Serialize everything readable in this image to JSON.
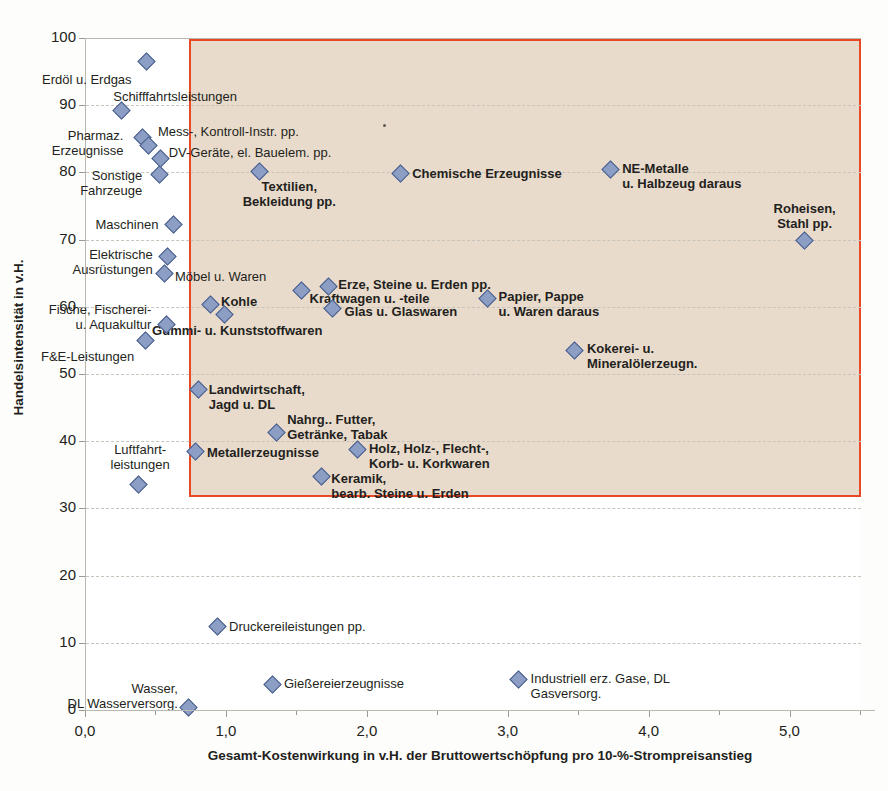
{
  "chart_data": {
    "type": "scatter",
    "title": "",
    "xlabel": "Gesamt-Kostenwirkung in v.H. der Bruttowertschöpfung pro 10-%-Strompreisanstieg",
    "ylabel": "Handelsintensität in v.H.",
    "xlim": [
      0.0,
      5.5
    ],
    "ylim": [
      0,
      100
    ],
    "xticks": [
      "0,0",
      "1,0",
      "2,0",
      "3,0",
      "4,0",
      "5,0"
    ],
    "xtick_values": [
      0.0,
      1.0,
      2.0,
      3.0,
      4.0,
      5.0
    ],
    "yticks": [
      "0",
      "10",
      "20",
      "30",
      "40",
      "50",
      "60",
      "70",
      "80",
      "90",
      "100"
    ],
    "ytick_values": [
      0,
      10,
      20,
      30,
      40,
      50,
      60,
      70,
      80,
      90,
      100
    ],
    "grid": true,
    "legend": "none",
    "marker": "diamond",
    "marker_color": "#8c9ec4",
    "marker_edge_color": "#4a5f8e",
    "highlight_region": {
      "x_min": 0.73,
      "x_max": 5.5,
      "y_min": 31,
      "y_max": 100,
      "fill": "#e9dac9",
      "border_color": "#e8411c",
      "note": "shaded quadrant marking high trade intensity and high cost impact"
    },
    "points": [
      {
        "label": "Erdöl u. Erdgas",
        "x": 0.43,
        "y": 96.5,
        "bold": false,
        "align": "rgt",
        "lx": -14,
        "ly": 10,
        "lines": [
          "Erdöl u. Erdgas"
        ]
      },
      {
        "label": "Schifffahrtsleistungen",
        "x": 0.25,
        "y": 89.2,
        "bold": false,
        "align": "lft",
        "lx": -8,
        "ly": -22,
        "lines": [
          "Schifffahrtsleistungen"
        ]
      },
      {
        "label": "Pharmaz. Erzeugnisse",
        "x": 0.4,
        "y": 85.2,
        "bold": false,
        "align": "rgt",
        "lx": -18,
        "ly": -9,
        "lines": [
          "Pharmaz.",
          "Erzeugnisse"
        ]
      },
      {
        "label": "Mess-, Kontroll-Instr. pp.",
        "x": 0.44,
        "y": 84.0,
        "bold": false,
        "align": "lft",
        "lx": 10,
        "ly": -22,
        "lines": [
          "Mess-, Kontroll-Instr. pp."
        ]
      },
      {
        "label": "DV-Geräte, el. Bauelem. pp.",
        "x": 0.53,
        "y": 82.0,
        "bold": false,
        "align": "lft",
        "lx": 8,
        "ly": -14,
        "lines": [
          "DV-Geräte, el. Bauelem. pp."
        ]
      },
      {
        "label": "Sonstige Fahrzeuge",
        "x": 0.52,
        "y": 79.7,
        "bold": false,
        "align": "rgt",
        "lx": -16,
        "ly": -6,
        "lines": [
          "Sonstige",
          "Fahrzeuge"
        ]
      },
      {
        "label": "Textilien, Bekleidung pp.",
        "x": 1.23,
        "y": 80.2,
        "bold": true,
        "align": "ctr",
        "lx": 30,
        "ly": 8,
        "lines": [
          "Textilien,",
          "Bekleidung pp."
        ]
      },
      {
        "label": "Chemische Erzeugnisse",
        "x": 2.23,
        "y": 79.8,
        "bold": true,
        "align": "lft",
        "lx": 12,
        "ly": -8,
        "lines": [
          "Chemische Erzeugnisse"
        ]
      },
      {
        "label": "NE-Metalle u. Halbzeug daraus",
        "x": 3.72,
        "y": 80.5,
        "bold": true,
        "align": "lft",
        "lx": 12,
        "ly": -8,
        "lines": [
          "NE-Metalle",
          "u. Halbzeug daraus"
        ]
      },
      {
        "label": "Roheisen, Stahl pp.",
        "x": 5.1,
        "y": 69.8,
        "bold": true,
        "align": "ctr",
        "lx": 0,
        "ly": -40,
        "lines": [
          "Roheisen,",
          "Stahl pp."
        ]
      },
      {
        "label": "Maschinen",
        "x": 0.62,
        "y": 72.2,
        "bold": false,
        "align": "rgt",
        "lx": -14,
        "ly": -8,
        "lines": [
          "Maschinen"
        ]
      },
      {
        "label": "Elektrische Ausrüstungen",
        "x": 0.58,
        "y": 67.5,
        "bold": false,
        "align": "rgt",
        "lx": -14,
        "ly": -9,
        "lines": [
          "Elektrische",
          "Ausrüstungen"
        ]
      },
      {
        "label": "Möbel u. Waren",
        "x": 0.56,
        "y": 65.0,
        "bold": false,
        "align": "lft",
        "lx": 10,
        "ly": -4,
        "lines": [
          "Möbel u. Waren"
        ]
      },
      {
        "label": "Kohle",
        "x": 0.88,
        "y": 60.3,
        "bold": true,
        "align": "lft",
        "lx": 11,
        "ly": -11,
        "lines": [
          "Kohle"
        ]
      },
      {
        "label": "Gummi- u. Kunststoffwaren",
        "x": 0.98,
        "y": 58.8,
        "bold": true,
        "align": "ctr",
        "lx": 8,
        "ly": 8,
        "lines": [
          "Gummi- u. Kunststoffwaren"
        ]
      },
      {
        "label": "Kraftwagen u. -teile",
        "x": 1.53,
        "y": 62.5,
        "bold": true,
        "align": "lft",
        "lx": 8,
        "ly": 1,
        "lines": [
          "Kraftwagen u. -teile"
        ]
      },
      {
        "label": "Erze, Steine u. Erden pp.",
        "x": 1.72,
        "y": 63.0,
        "bold": true,
        "align": "lft",
        "lx": 10,
        "ly": -10,
        "lines": [
          "Erze, Steine u. Erden pp."
        ]
      },
      {
        "label": "Glas u. Glaswaren",
        "x": 1.75,
        "y": 59.7,
        "bold": true,
        "align": "lft",
        "lx": 12,
        "ly": -5,
        "lines": [
          "Glas u. Glaswaren"
        ]
      },
      {
        "label": "Papier, Pappe u. Waren daraus",
        "x": 2.85,
        "y": 61.3,
        "bold": true,
        "align": "lft",
        "lx": 11,
        "ly": -9,
        "lines": [
          "Papier, Pappe",
          "u. Waren daraus"
        ]
      },
      {
        "label": "Fische, Fischerei- u. Aquakultur",
        "x": 0.57,
        "y": 57.3,
        "bold": false,
        "align": "rgt",
        "lx": -14,
        "ly": -23,
        "lines": [
          "Fische, Fischerei-",
          "u. Aquakultur"
        ]
      },
      {
        "label": "F&E-Leistungen",
        "x": 0.42,
        "y": 55.0,
        "bold": false,
        "align": "rgt",
        "lx": -10,
        "ly": 9,
        "lines": [
          "F&E-Leistungen"
        ]
      },
      {
        "label": "Kokerei- u. Mineralölerzeugn.",
        "x": 3.47,
        "y": 53.5,
        "bold": true,
        "align": "lft",
        "lx": 12,
        "ly": -9,
        "lines": [
          "Kokerei- u.",
          "Mineralölerzeugn."
        ]
      },
      {
        "label": "Landwirtschaft, Jagd u. DL",
        "x": 0.8,
        "y": 47.7,
        "bold": true,
        "align": "lft",
        "lx": 10,
        "ly": -7,
        "lines": [
          "Landwirtschaft,",
          "Jagd u. DL"
        ]
      },
      {
        "label": "Nahrg.. Futter, Getränke, Tabak",
        "x": 1.35,
        "y": 41.3,
        "bold": true,
        "align": "lft",
        "lx": 11,
        "ly": -20,
        "lines": [
          "Nahrg.. Futter,",
          "Getränke, Tabak"
        ]
      },
      {
        "label": "Metallerzeugnisse",
        "x": 0.78,
        "y": 38.4,
        "bold": true,
        "align": "lft",
        "lx": 11,
        "ly": -7,
        "lines": [
          "Metallerzeugnisse"
        ]
      },
      {
        "label": "Holz, Holz-, Flecht-, Korb- u. Korkwaren",
        "x": 1.93,
        "y": 38.8,
        "bold": true,
        "align": "lft",
        "lx": 11,
        "ly": -8,
        "lines": [
          "Holz, Holz-, Flecht-,",
          "Korb- u. Korkwaren"
        ]
      },
      {
        "label": "Keramik, bearb. Steine u. Erden",
        "x": 1.67,
        "y": 34.7,
        "bold": true,
        "align": "lft",
        "lx": 10,
        "ly": -6,
        "lines": [
          "Keramik,",
          "bearb. Steine u. Erden"
        ]
      },
      {
        "label": "Luftfahrtleistungen",
        "x": 0.37,
        "y": 33.6,
        "bold": false,
        "align": "ctr",
        "lx": 2,
        "ly": -42,
        "lines": [
          "Luftfahrt-",
          "leistungen"
        ]
      },
      {
        "label": "Druckereileistungen pp.",
        "x": 0.93,
        "y": 12.4,
        "bold": false,
        "align": "lft",
        "lx": 12,
        "ly": -8,
        "lines": [
          "Druckereileistungen pp."
        ]
      },
      {
        "label": "Gießereierzeugnisse",
        "x": 1.32,
        "y": 3.8,
        "bold": false,
        "align": "lft",
        "lx": 12,
        "ly": -8,
        "lines": [
          "Gießereierzeugnisse"
        ]
      },
      {
        "label": "Industriell erz. Gase, DL Gasversorg.",
        "x": 3.07,
        "y": 4.5,
        "bold": false,
        "align": "lft",
        "lx": 12,
        "ly": -9,
        "lines": [
          "Industriell erz. Gase, DL",
          "Gasversorg."
        ]
      },
      {
        "label": "Wasser, DL Wasserversorg.",
        "x": 0.73,
        "y": 0.4,
        "bold": false,
        "align": "rgt",
        "lx": -10,
        "ly": -26,
        "lines": [
          "Wasser,",
          "DL Wasserversorg."
        ]
      }
    ]
  }
}
